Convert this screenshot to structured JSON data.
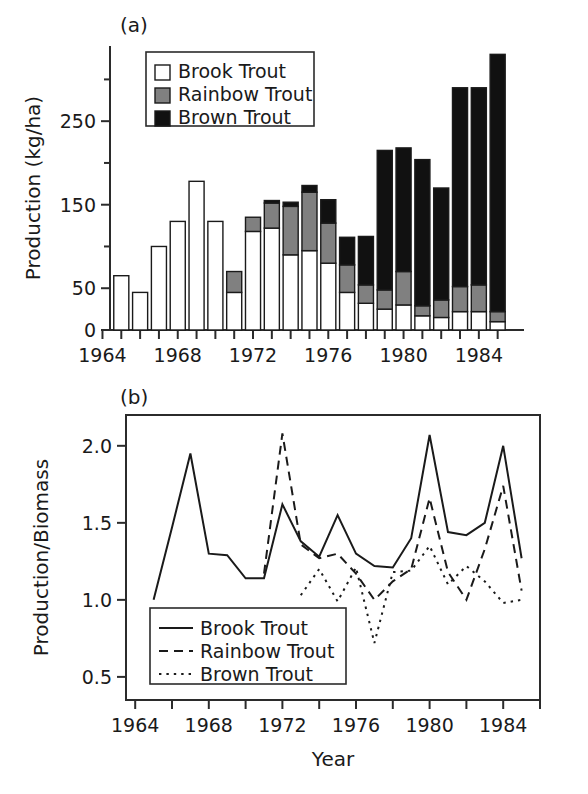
{
  "figure": {
    "panel_a_label": "(a)",
    "panel_b_label": "(b)",
    "xlabel": "Year"
  },
  "colors": {
    "brook": "#ffffff",
    "rainbow": "#808080",
    "brown": "#111111",
    "axis": "#2b2b2b",
    "outline": "#1a1a1a"
  },
  "chart_data": [
    {
      "type": "bar",
      "id": "panel-a",
      "title": "(a)",
      "stacked": true,
      "xlabel": "",
      "ylabel": "Production (kg/ha)",
      "xlim": [
        1964,
        1986
      ],
      "ylim": [
        0,
        340
      ],
      "yticks_major": [
        0,
        50,
        150,
        250
      ],
      "yticks_minor": [
        100,
        200,
        300
      ],
      "ytick_labels": [
        "0",
        "50",
        "150",
        "250"
      ],
      "xticks": [
        1964,
        1965,
        1966,
        1967,
        1968,
        1969,
        1970,
        1971,
        1972,
        1973,
        1974,
        1975,
        1976,
        1977,
        1978,
        1979,
        1980,
        1981,
        1982,
        1983,
        1984,
        1985
      ],
      "xtick_labels_shown": [
        "1964",
        "1968",
        "1972",
        "1976",
        "1980",
        "1984"
      ],
      "xtick_labels_years": [
        1964,
        1968,
        1972,
        1976,
        1980,
        1984
      ],
      "grid": false,
      "legend_position": "top-left",
      "categories": [
        1965,
        1966,
        1967,
        1968,
        1969,
        1970,
        1971,
        1972,
        1973,
        1974,
        1975,
        1976,
        1977,
        1978,
        1979,
        1980,
        1981,
        1982,
        1983,
        1984,
        1985
      ],
      "series": [
        {
          "name": "Brook Trout",
          "key": "brook",
          "values": [
            65,
            45,
            100,
            130,
            178,
            130,
            45,
            118,
            122,
            90,
            95,
            80,
            45,
            32,
            25,
            30,
            17,
            15,
            22,
            22,
            10
          ]
        },
        {
          "name": "Rainbow Trout",
          "key": "rainbow",
          "values": [
            0,
            0,
            0,
            0,
            0,
            0,
            25,
            17,
            30,
            58,
            70,
            48,
            33,
            22,
            23,
            40,
            12,
            21,
            30,
            32,
            12
          ]
        },
        {
          "name": "Brown Trout",
          "key": "brown",
          "values": [
            0,
            0,
            0,
            0,
            0,
            0,
            0,
            0,
            3,
            5,
            8,
            28,
            33,
            58,
            167,
            148,
            175,
            134,
            238,
            236,
            308
          ]
        }
      ]
    },
    {
      "type": "line",
      "id": "panel-b",
      "title": "(b)",
      "xlabel": "Year",
      "ylabel": "Production/Biomass",
      "xlim": [
        1963.5,
        1986
      ],
      "ylim": [
        0.35,
        2.2
      ],
      "yticks": [
        0.5,
        1.0,
        1.5,
        2.0
      ],
      "ytick_labels": [
        "0.5",
        "1.0",
        "1.5",
        "2.0"
      ],
      "xticks": [
        1964,
        1966,
        1968,
        1970,
        1972,
        1974,
        1976,
        1978,
        1980,
        1982,
        1984,
        1986
      ],
      "xtick_labels_shown": [
        "1964",
        "1968",
        "1972",
        "1976",
        "1980",
        "1984"
      ],
      "xtick_labels_years": [
        1964,
        1968,
        1972,
        1976,
        1980,
        1984
      ],
      "grid": false,
      "legend_position": "bottom-left",
      "series": [
        {
          "name": "Brook Trout",
          "key": "brook",
          "dash": "solid",
          "x": [
            1965,
            1966,
            1967,
            1968,
            1969,
            1970,
            1971,
            1972,
            1973,
            1974,
            1975,
            1976,
            1977,
            1978,
            1979,
            1980,
            1981,
            1982,
            1983,
            1984,
            1985
          ],
          "y": [
            1.0,
            1.47,
            1.95,
            1.3,
            1.29,
            1.14,
            1.14,
            1.62,
            1.38,
            1.28,
            1.55,
            1.3,
            1.22,
            1.21,
            1.4,
            2.07,
            1.44,
            1.42,
            1.5,
            2.0,
            1.27
          ]
        },
        {
          "name": "Rainbow Trout",
          "key": "rainbow",
          "dash": "dashed",
          "x": [
            1971,
            1972,
            1973,
            1974,
            1975,
            1976,
            1977,
            1978,
            1979,
            1980,
            1981,
            1982,
            1983,
            1984,
            1985
          ],
          "y": [
            1.17,
            2.08,
            1.36,
            1.27,
            1.3,
            1.17,
            1.0,
            1.12,
            1.2,
            1.66,
            1.18,
            1.0,
            1.33,
            1.74,
            1.06
          ]
        },
        {
          "name": "Brown Trout",
          "key": "brown",
          "dash": "dotted",
          "x": [
            1973,
            1974,
            1975,
            1976,
            1977,
            1978,
            1979,
            1980,
            1981,
            1982,
            1983,
            1984,
            1985
          ],
          "y": [
            1.03,
            1.2,
            0.99,
            1.21,
            0.72,
            1.18,
            1.19,
            1.35,
            1.1,
            1.22,
            1.12,
            0.98,
            1.0
          ]
        }
      ]
    }
  ],
  "panel_a": {
    "legend": {
      "items": [
        {
          "label": "Brook Trout",
          "swatch": "open-square-icon"
        },
        {
          "label": "Rainbow Trout",
          "swatch": "gray-square-icon"
        },
        {
          "label": "Brown Trout",
          "swatch": "black-square-icon"
        }
      ]
    },
    "ylabel": "Production (kg/ha)"
  },
  "panel_b": {
    "legend": {
      "items": [
        {
          "label": "Brook Trout",
          "swatch": "solid-line-icon"
        },
        {
          "label": "Rainbow Trout",
          "swatch": "dashed-line-icon"
        },
        {
          "label": "Brown Trout",
          "swatch": "dotted-line-icon"
        }
      ]
    },
    "ylabel": "Production/Biomass"
  }
}
